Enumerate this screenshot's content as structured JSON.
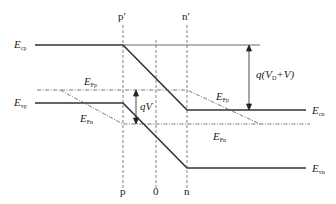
{
  "diagram": {
    "type": "pn-junction-energy-band-diagram-reverse-bias",
    "colors": {
      "band_line": "#333333",
      "guide_line": "#555555",
      "background": "#ffffff"
    },
    "position_labels": {
      "p_prime": "p′",
      "n_prime": "n′",
      "p": "p",
      "zero": "0",
      "n": "n"
    },
    "energy_labels": {
      "E_cp": {
        "main": "E",
        "sub": "cp"
      },
      "E_vp": {
        "main": "E",
        "sub": "vp"
      },
      "E_Fp_left": {
        "main": "E",
        "sub": "Fp"
      },
      "E_Fn_left": {
        "main": "E",
        "sub": "Fn"
      },
      "E_Fp_right": {
        "main": "E",
        "sub": "Fp"
      },
      "E_Fn_right": {
        "main": "E",
        "sub": "Fn"
      },
      "E_cn": {
        "main": "E",
        "sub": "cn"
      },
      "E_vn": {
        "main": "E",
        "sub": "vn"
      }
    },
    "annotations": {
      "qV": {
        "prefix": "q",
        "var": "V"
      },
      "barrier": {
        "prefix": "q(",
        "v": "V",
        "sub": "D",
        "suffix": "+V)"
      }
    }
  }
}
